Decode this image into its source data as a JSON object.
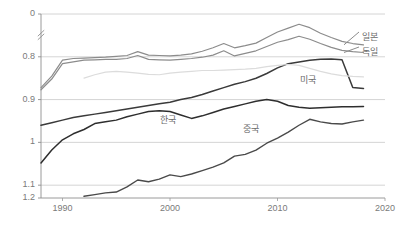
{
  "chart_data": {
    "type": "line",
    "title": "",
    "subtitle": "",
    "xlabel": "",
    "ylabel": "",
    "xlim": [
      1988,
      2020
    ],
    "ylim": [
      0.77,
      1.2
    ],
    "grid": true,
    "grid_axis": "y",
    "legend_position": "right-inline",
    "y_axis_break": true,
    "y_break_between": [
      "0",
      "0.8"
    ],
    "xticks": [
      "1990",
      "2000",
      "2010",
      "2020"
    ],
    "xtick_values": [
      1990,
      2000,
      2010,
      2020
    ],
    "yticks": [
      "0",
      "0.8",
      "0.9",
      "1",
      "1.1",
      "1.2"
    ],
    "ytick_values": [
      0.77,
      0.8,
      0.9,
      1.0,
      1.1,
      1.2
    ],
    "series": [
      {
        "name": "일본",
        "color": "#8c8c8c",
        "width": 1.2,
        "x": [
          1988,
          1989,
          1990,
          1991,
          1992,
          1993,
          1994,
          1995,
          1996,
          1997,
          1998,
          1999,
          2000,
          2001,
          2002,
          2003,
          2004,
          2005,
          2006,
          2007,
          2008,
          2009,
          2010,
          2011,
          2012,
          2013,
          2014,
          2015,
          2016,
          2017,
          2018
        ],
        "values": [
          1.028,
          1.055,
          1.092,
          1.096,
          1.097,
          1.098,
          1.099,
          1.101,
          1.103,
          1.112,
          1.104,
          1.103,
          1.102,
          1.104,
          1.107,
          1.113,
          1.121,
          1.131,
          1.121,
          1.126,
          1.132,
          1.145,
          1.158,
          1.167,
          1.176,
          1.168,
          1.155,
          1.145,
          1.136,
          1.131,
          1.128
        ]
      },
      {
        "name": "독일",
        "color": "#8c8c8c",
        "width": 1.2,
        "x": [
          1988,
          1989,
          1990,
          1991,
          1992,
          1993,
          1994,
          1995,
          1996,
          1997,
          1998,
          1999,
          2000,
          2001,
          2002,
          2003,
          2004,
          2005,
          2006,
          2007,
          2008,
          2009,
          2010,
          2011,
          2012,
          2013,
          2014,
          2015,
          2016,
          2017,
          2018
        ],
        "values": [
          1.023,
          1.048,
          1.084,
          1.088,
          1.092,
          1.093,
          1.094,
          1.094,
          1.096,
          1.103,
          1.094,
          1.093,
          1.092,
          1.094,
          1.096,
          1.099,
          1.104,
          1.114,
          1.102,
          1.108,
          1.114,
          1.124,
          1.134,
          1.14,
          1.148,
          1.141,
          1.131,
          1.122,
          1.115,
          1.112,
          1.11
        ]
      },
      {
        "name": "미국",
        "color": "#3a3a3a",
        "width": 1.5,
        "x": [
          1988,
          1989,
          1990,
          1991,
          1992,
          1993,
          1994,
          1995,
          1996,
          1997,
          1998,
          1999,
          2000,
          2001,
          2002,
          2003,
          2004,
          2005,
          2006,
          2007,
          2008,
          2009,
          2010,
          2011,
          2012,
          2013,
          2014,
          2015,
          2016,
          2017,
          2018
        ],
        "values": [
          0.94,
          0.946,
          0.952,
          0.958,
          0.962,
          0.966,
          0.97,
          0.974,
          0.978,
          0.982,
          0.986,
          0.99,
          0.994,
          1.0,
          1.005,
          1.012,
          1.02,
          1.028,
          1.036,
          1.042,
          1.05,
          1.061,
          1.074,
          1.084,
          1.088,
          1.092,
          1.094,
          1.095,
          1.093,
          1.028,
          1.026
        ]
      },
      {
        "name": "한국",
        "color": "#2e2e2e",
        "width": 1.5,
        "x": [
          1988,
          1989,
          1990,
          1991,
          1992,
          1993,
          1994,
          1995,
          1996,
          1997,
          1998,
          1999,
          2000,
          2001,
          2002,
          2003,
          2004,
          2005,
          2006,
          2007,
          2008,
          2009,
          2010,
          2011,
          2012,
          2013,
          2014,
          2015,
          2016,
          2017,
          2018
        ],
        "values": [
          0.852,
          0.882,
          0.906,
          0.92,
          0.93,
          0.944,
          0.948,
          0.952,
          0.96,
          0.966,
          0.972,
          0.974,
          0.972,
          0.964,
          0.956,
          0.962,
          0.97,
          0.978,
          0.984,
          0.99,
          0.996,
          1.0,
          0.996,
          0.986,
          0.982,
          0.98,
          0.981,
          0.982,
          0.983,
          0.983,
          0.984
        ]
      },
      {
        "name": "중국",
        "color": "#4a4a4a",
        "width": 1.4,
        "x": [
          1992,
          1993,
          1994,
          1995,
          1996,
          1997,
          1998,
          1999,
          2000,
          2001,
          2002,
          2003,
          2004,
          2005,
          2006,
          2007,
          2008,
          2009,
          2010,
          2011,
          2012,
          2013,
          2014,
          2015,
          2016,
          2017,
          2018
        ],
        "values": [
          0.774,
          0.778,
          0.782,
          0.784,
          0.796,
          0.812,
          0.808,
          0.814,
          0.824,
          0.82,
          0.826,
          0.834,
          0.842,
          0.852,
          0.868,
          0.872,
          0.882,
          0.898,
          0.91,
          0.924,
          0.94,
          0.954,
          0.948,
          0.944,
          0.943,
          0.948,
          0.952
        ]
      },
      {
        "name": "",
        "color": "#dcdcdc",
        "width": 1.2,
        "x": [
          1992,
          1993,
          1994,
          1995,
          1996,
          1997,
          1998,
          1999,
          2000,
          2001,
          2002,
          2003,
          2004,
          2005,
          2006,
          2007,
          2008,
          2009,
          2010,
          2011,
          2012,
          2013,
          2014,
          2015,
          2016,
          2017,
          2018
        ],
        "values": [
          1.05,
          1.058,
          1.064,
          1.066,
          1.064,
          1.062,
          1.059,
          1.058,
          1.062,
          1.064,
          1.066,
          1.068,
          1.068,
          1.069,
          1.07,
          1.071,
          1.073,
          1.077,
          1.08,
          1.082,
          1.08,
          1.073,
          1.066,
          1.06,
          1.056,
          1.054,
          1.053
        ]
      }
    ],
    "annotations": [
      {
        "text": "일본",
        "x_px": 362,
        "y_px": 30,
        "kind": "legend"
      },
      {
        "text": "독일",
        "x_px": 362,
        "y_px": 45,
        "kind": "legend"
      },
      {
        "text": "미국",
        "x_px": 300,
        "y_px": 73,
        "kind": "inline"
      },
      {
        "text": "한국",
        "x_px": 160,
        "y_px": 113,
        "kind": "inline"
      },
      {
        "text": "중국",
        "x_px": 243,
        "y_px": 122,
        "kind": "inline"
      }
    ]
  },
  "axis": {
    "ylabels": [
      "1.2",
      "1.1",
      "1",
      "0.9",
      "0.8",
      "0"
    ],
    "xlabels": [
      "1990",
      "2000",
      "2010",
      "2020"
    ]
  }
}
